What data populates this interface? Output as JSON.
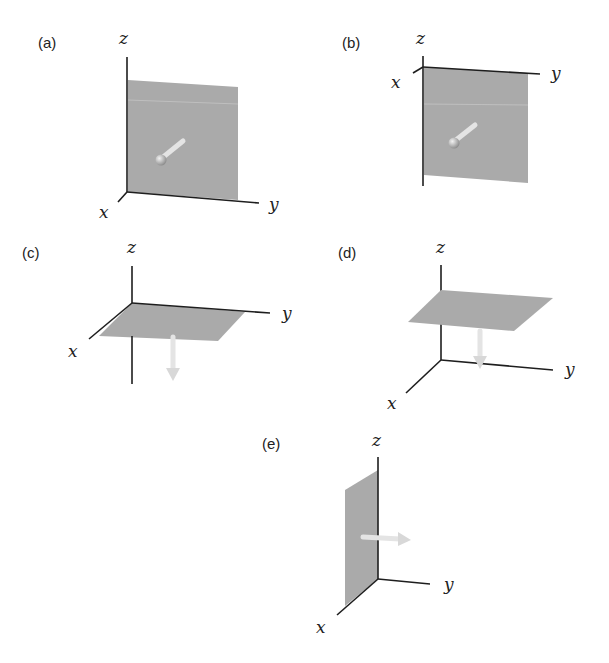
{
  "figure": {
    "colors": {
      "plane": "#aaaaaa",
      "axis": "#1e1e1e",
      "arrow": "#e4e4e4",
      "background": "#ffffff"
    },
    "panels": [
      {
        "id": "a",
        "label": "(a)",
        "axes": {
          "x": "x",
          "y": "y",
          "z": "z"
        },
        "plane": "yz-plane (vertical, facing viewer)",
        "arrow": "normal pointing toward +x (out of page)"
      },
      {
        "id": "b",
        "label": "(b)",
        "axes": {
          "x": "x",
          "y": "y",
          "z": "z"
        },
        "plane": "yz-plane hanging below y-axis",
        "arrow": "normal pointing toward +x"
      },
      {
        "id": "c",
        "label": "(c)",
        "axes": {
          "x": "x",
          "y": "y",
          "z": "z"
        },
        "plane": "xy-plane at origin",
        "arrow": "normal pointing toward -z"
      },
      {
        "id": "d",
        "label": "(d)",
        "axes": {
          "x": "x",
          "y": "y",
          "z": "z"
        },
        "plane": "horizontal plane above origin",
        "arrow": "normal pointing toward -z"
      },
      {
        "id": "e",
        "label": "(e)",
        "axes": {
          "x": "x",
          "y": "y",
          "z": "z"
        },
        "plane": "xz-plane",
        "arrow": "normal pointing toward +y"
      }
    ]
  }
}
